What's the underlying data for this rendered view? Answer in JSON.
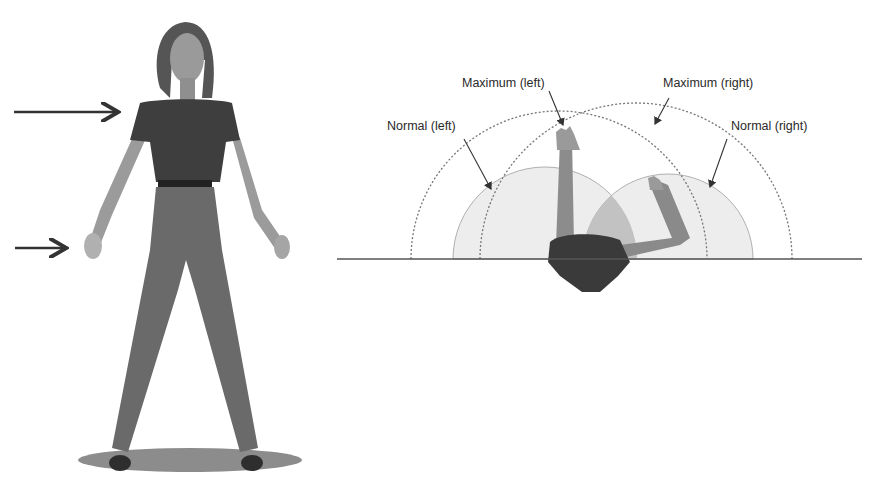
{
  "figure": {
    "left_panel": {
      "subject": "standing-female-figure-front-view",
      "arrows": [
        {
          "name": "shoulder-height-arrow",
          "y": 112
        },
        {
          "name": "hand-height-arrow",
          "y": 248
        }
      ]
    },
    "right_panel": {
      "subject": "top-view-reach-envelope",
      "labels": {
        "max_left": "Maximum (left)",
        "max_right": "Maximum (right)",
        "normal_left": "Normal (left)",
        "normal_right": "Normal (right)"
      },
      "zones": [
        {
          "name": "normal-left-zone",
          "type": "shaded-arc",
          "fill": "#ececec"
        },
        {
          "name": "normal-right-zone",
          "type": "shaded-arc",
          "fill": "#ececec"
        },
        {
          "name": "overlap-zone",
          "type": "shaded-arc",
          "fill": "#bdbdbd"
        },
        {
          "name": "maximum-left-boundary",
          "type": "dotted-arc"
        },
        {
          "name": "maximum-right-boundary",
          "type": "dotted-arc"
        }
      ],
      "colors": {
        "line": "#555555",
        "shirt": "#3a3a3a",
        "skin": "#8a8a8a",
        "pants": "#6e6e6e"
      }
    }
  }
}
